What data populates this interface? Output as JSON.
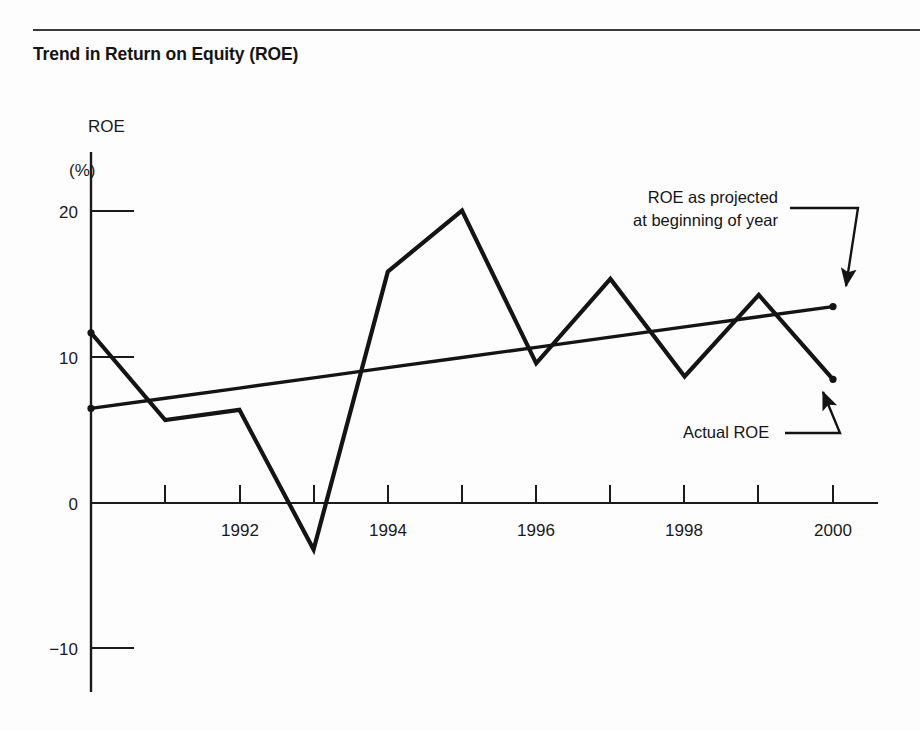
{
  "figure": {
    "title": "Trend in Return on Equity (ROE)",
    "y_axis_label_line1": "ROE",
    "y_axis_label_line2": "(%)"
  },
  "annotations": {
    "projected_line1": "ROE as projected",
    "projected_line2": "at beginning of year",
    "actual": "Actual  ROE"
  },
  "colors": {
    "ink": "#141414",
    "axis": "#1a1a1a",
    "rule": "#3a3a3a",
    "background": "#fdfdfd"
  },
  "chart_data": {
    "type": "line",
    "title": "Trend in Return on Equity (ROE)",
    "xlabel": "",
    "ylabel": "ROE (%)",
    "xlim": [
      1990,
      2000.6
    ],
    "ylim": [
      -13,
      22
    ],
    "grid": false,
    "legend": "annotations-with-arrows",
    "x": [
      1990,
      1991,
      1992,
      1993,
      1994,
      1995,
      1996,
      1997,
      1998,
      1999,
      2000
    ],
    "x_tick_values": [
      1992,
      1994,
      1996,
      1998,
      2000
    ],
    "x_tick_labels": [
      "1992",
      "1994",
      "1996",
      "1998",
      "2000"
    ],
    "x_minor_ticks": [
      1991,
      1992,
      1993,
      1994,
      1995,
      1996,
      1997,
      1998,
      1999,
      2000
    ],
    "y_tick_values": [
      20,
      10,
      0,
      -10
    ],
    "y_tick_labels": [
      "20",
      "10",
      "0",
      "−10"
    ],
    "series": [
      {
        "name": "Actual ROE",
        "marker": "dot-endpoints",
        "values": [
          11.7,
          5.7,
          6.4,
          -3.2,
          15.9,
          20.1,
          9.6,
          15.4,
          8.7,
          14.3,
          8.5
        ]
      },
      {
        "name": "ROE as projected at beginning of year",
        "marker": "dot-endpoints",
        "values": [
          6.5,
          7.2,
          7.9,
          8.6,
          9.3,
          10.0,
          10.7,
          11.4,
          12.1,
          12.8,
          13.5
        ]
      }
    ]
  }
}
